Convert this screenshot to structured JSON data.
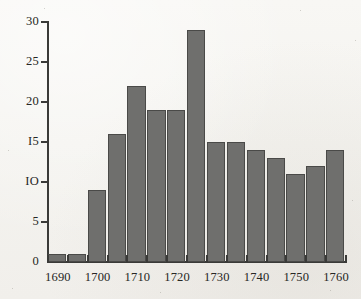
{
  "chart_data": {
    "type": "bar",
    "title": "",
    "subtitle": "",
    "xlabel": "",
    "ylabel": "",
    "grid": false,
    "legend": null,
    "bin_width_years": 5,
    "xlim": [
      1690,
      1765
    ],
    "ylim": [
      0,
      30
    ],
    "y_ticks": [
      0,
      5,
      10,
      15,
      20,
      25,
      30
    ],
    "y_tick_labels": [
      "0",
      "5",
      "IO",
      "I5",
      "20",
      "25",
      "30"
    ],
    "x_ticks": [
      1690,
      1700,
      1710,
      1720,
      1730,
      1740,
      1750,
      1760
    ],
    "x_tick_labels": [
      "1690",
      "1700",
      "1710",
      "1720",
      "1730",
      "1740",
      "1750",
      "1760"
    ],
    "categories": [
      "1690",
      "1695",
      "1700",
      "1705",
      "1710",
      "1715",
      "1720",
      "1725",
      "1730",
      "1735",
      "1740",
      "1745",
      "1750",
      "1755",
      "1760"
    ],
    "values": [
      1,
      1,
      9,
      16,
      22,
      19,
      19,
      29,
      15,
      15,
      14,
      13,
      11,
      12,
      14
    ],
    "bar_color": "#6f6f6d",
    "bar_edge_color": "#4a4a48",
    "background_color": "#f6f5f2",
    "axis_color": "#3a3a38"
  }
}
